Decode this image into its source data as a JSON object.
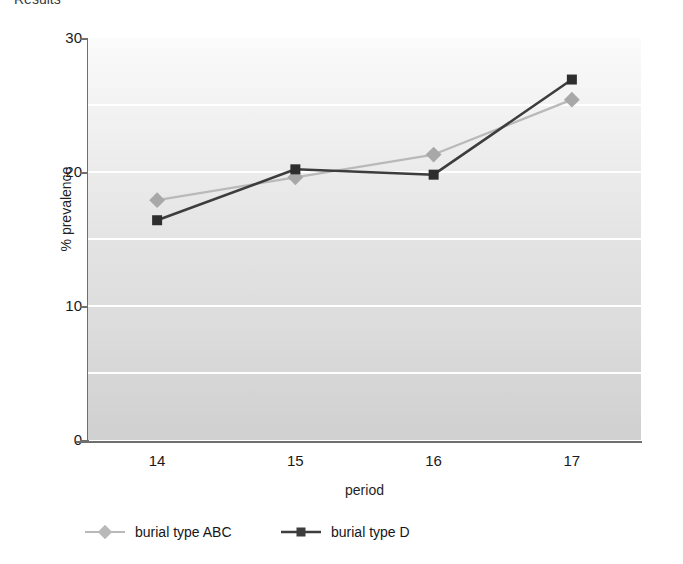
{
  "header": {
    "cut_off_heading": "Results"
  },
  "chart_data": {
    "type": "line",
    "title": "",
    "xlabel": "period",
    "ylabel": "% prevalence",
    "categories": [
      "14",
      "15",
      "16",
      "17"
    ],
    "x": [
      14,
      15,
      16,
      17
    ],
    "ylim": [
      0,
      30
    ],
    "yticks": [
      0,
      10,
      20,
      30
    ],
    "ytick_labels": [
      "0",
      "10",
      "20",
      "30"
    ],
    "gridlines": [
      5,
      10,
      15,
      20,
      25
    ],
    "grid": true,
    "grid_color": "#ffffff",
    "legend_position": "bottom-left",
    "plot_background": "light-gray-gradient",
    "series": [
      {
        "name": "burial type ABC",
        "values": [
          17.9,
          19.6,
          21.3,
          25.4
        ],
        "color": "#b9b9b9",
        "marker": "diamond",
        "marker_color": "#a8a8a8"
      },
      {
        "name": "burial type D",
        "values": [
          16.4,
          20.2,
          19.8,
          26.9
        ],
        "color": "#3d3d3d",
        "marker": "square",
        "marker_color": "#2e2e2e"
      }
    ]
  },
  "legend": {
    "items": [
      {
        "label": "burial type ABC",
        "color": "#b9b9b9",
        "marker": "diamond"
      },
      {
        "label": "burial type D",
        "color": "#3d3d3d",
        "marker": "square"
      }
    ]
  }
}
